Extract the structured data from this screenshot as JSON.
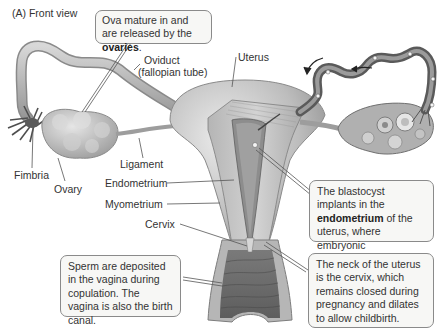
{
  "figure": {
    "panel_title": "(A)  Front view",
    "labels": {
      "oviduct_line1": "Oviduct",
      "oviduct_line2": "(fallopian tube)",
      "uterus": "Uterus",
      "fimbria": "Fimbria",
      "ovary": "Ovary",
      "ligament": "Ligament",
      "endometrium": "Endometrium",
      "myometrium": "Myometrium",
      "cervix": "Cervix"
    },
    "callouts": {
      "ovaries": {
        "before": "Ova mature in and are released by the ",
        "bold": "ovaries",
        "after": "."
      },
      "blastocyst": {
        "before": "The blastocyst implants in the ",
        "bold": "endometrium",
        "after": " of the uterus, where embryonic development continues."
      },
      "vagina": {
        "text": "Sperm are deposited in the vagina during copulation. The vagina is also the birth canal."
      },
      "cervix": {
        "text": "The neck of the uterus is the cervix, which remains closed during pregnancy and dilates to allow childbirth."
      }
    },
    "colors": {
      "tissue_light": "#c9c9c9",
      "tissue_mid": "#a8a8a8",
      "tissue_dark": "#6e6e6e",
      "callout_bg": "#f7f7f5",
      "callout_border": "#8a8a8a",
      "leader_line": "#555555"
    }
  }
}
